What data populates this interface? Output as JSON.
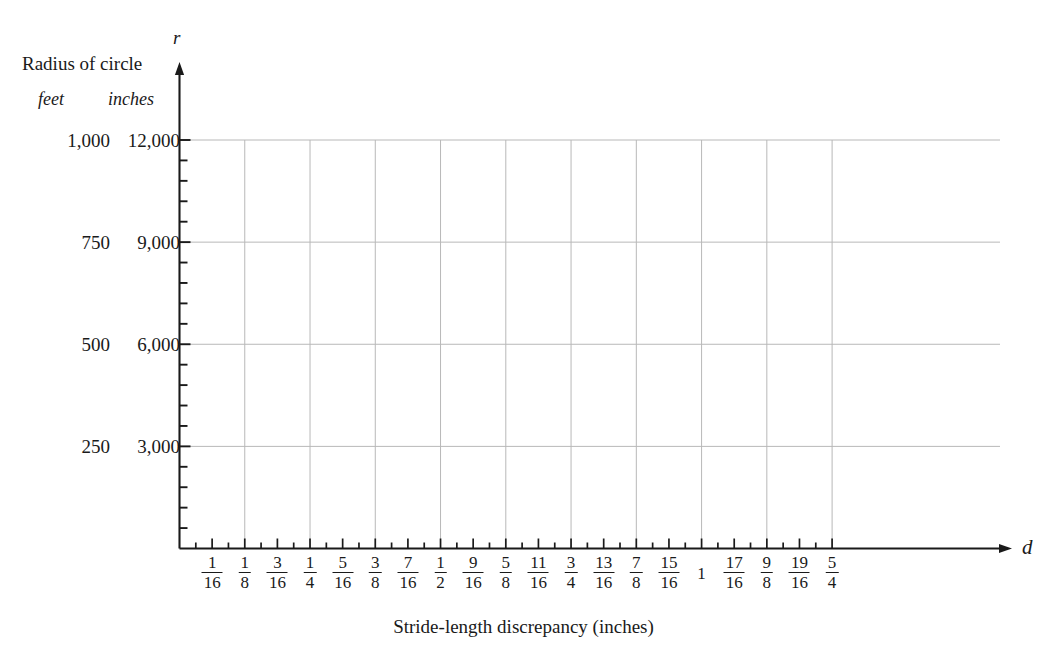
{
  "axes": {
    "y_header": "Radius of circle",
    "y_unit_primary": "feet",
    "y_unit_secondary": "inches",
    "y_variable_symbol": "r",
    "x_variable_symbol": "d",
    "x_title": "Stride-length discrepancy (inches)"
  },
  "chart_data": {
    "type": "line",
    "title": "",
    "subtitle": "",
    "xlabel": "Stride-length discrepancy (inches)",
    "ylabel": "Radius of circle",
    "grid": true,
    "legend": null,
    "series": [],
    "x": [],
    "values": [],
    "xlim": [
      0,
      1.3125
    ],
    "ylim": [
      0,
      13200
    ],
    "x_axis": {
      "variable": "d",
      "unit": "inches",
      "tick_step": "1/32",
      "labeled_tick_step": "1/16",
      "gridline_step": "1/8",
      "labeled_ticks": [
        {
          "label": "1/16",
          "num": "1",
          "den": "16",
          "value": 0.0625
        },
        {
          "label": "1/8",
          "num": "1",
          "den": "8",
          "value": 0.125
        },
        {
          "label": "3/16",
          "num": "3",
          "den": "16",
          "value": 0.1875
        },
        {
          "label": "1/4",
          "num": "1",
          "den": "4",
          "value": 0.25
        },
        {
          "label": "5/16",
          "num": "5",
          "den": "16",
          "value": 0.3125
        },
        {
          "label": "3/8",
          "num": "3",
          "den": "8",
          "value": 0.375
        },
        {
          "label": "7/16",
          "num": "7",
          "den": "16",
          "value": 0.4375
        },
        {
          "label": "1/2",
          "num": "1",
          "den": "2",
          "value": 0.5
        },
        {
          "label": "9/16",
          "num": "9",
          "den": "16",
          "value": 0.5625
        },
        {
          "label": "5/8",
          "num": "5",
          "den": "8",
          "value": 0.625
        },
        {
          "label": "11/16",
          "num": "11",
          "den": "16",
          "value": 0.6875
        },
        {
          "label": "3/4",
          "num": "3",
          "den": "4",
          "value": 0.75
        },
        {
          "label": "13/16",
          "num": "13",
          "den": "16",
          "value": 0.8125
        },
        {
          "label": "7/8",
          "num": "7",
          "den": "8",
          "value": 0.875
        },
        {
          "label": "15/16",
          "num": "15",
          "den": "16",
          "value": 0.9375
        },
        {
          "label": "1",
          "num": "1",
          "den": "",
          "value": 1.0
        },
        {
          "label": "17/16",
          "num": "17",
          "den": "16",
          "value": 1.0625
        },
        {
          "label": "9/8",
          "num": "9",
          "den": "8",
          "value": 1.125
        },
        {
          "label": "19/16",
          "num": "19",
          "den": "16",
          "value": 1.1875
        },
        {
          "label": "5/4",
          "num": "5",
          "den": "4",
          "value": 1.25
        }
      ]
    },
    "y_axis": {
      "variable": "r",
      "minor_ticks_per_major": 5,
      "major_ticks": [
        {
          "feet": "250",
          "inches": "3,000",
          "value": 3000
        },
        {
          "feet": "500",
          "inches": "6,000",
          "value": 6000
        },
        {
          "feet": "750",
          "inches": "9,000",
          "value": 9000
        },
        {
          "feet": "1,000",
          "inches": "12,000",
          "value": 12000
        }
      ]
    }
  },
  "colors": {
    "axis": "#1a1a1a",
    "gridline": "#b8b8b8",
    "text": "#1a1a1a",
    "background": "#ffffff"
  }
}
